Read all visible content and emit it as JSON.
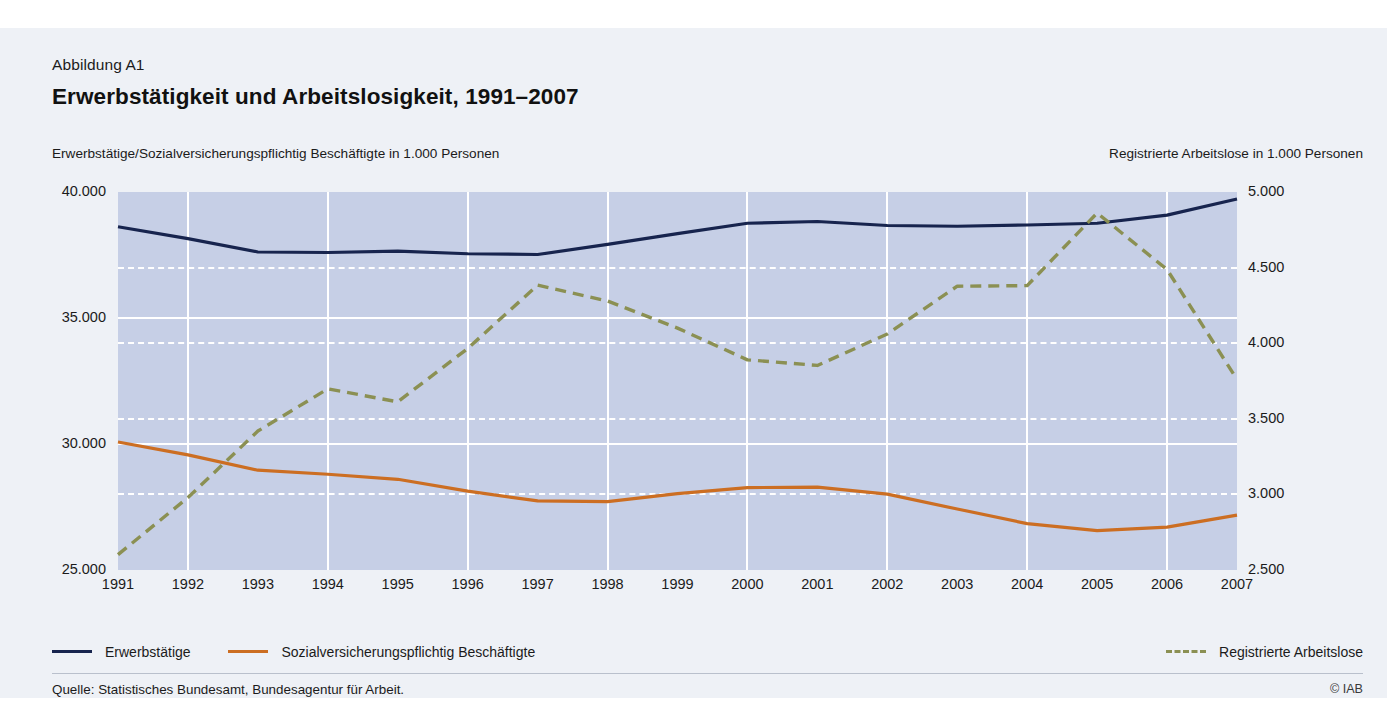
{
  "figure": {
    "label": "Abbildung A1",
    "title": "Erwerbstätigkeit und Arbeitslosigkeit, 1991–2007",
    "left_axis_caption": "Erwerbstätige/Sozialversicherungspflichtig Beschäftigte in 1.000 Personen",
    "right_axis_caption": "Registrierte Arbeitslose in 1.000 Personen",
    "source": "Quelle: Statistisches Bundesamt, Bundesagentur für Arbeit.",
    "copyright": "© IAB"
  },
  "colors": {
    "plot_background": "#c6cfe6",
    "page_background": "#eef1f6",
    "gridline": "#ffffff",
    "erwerbstaetige": "#17244e",
    "sozialversicherungspflichtig": "#cc6e22",
    "arbeitslose": "#8b9053"
  },
  "legend": {
    "items": [
      {
        "label": "Erwerbstätige",
        "style": "solid",
        "color": "#17244e",
        "axis": "left"
      },
      {
        "label": "Sozialversicherungspflichtig Beschäftigte",
        "style": "solid",
        "color": "#cc6e22",
        "axis": "left"
      },
      {
        "label": "Registrierte Arbeitslose",
        "style": "dashed",
        "color": "#8b9053",
        "axis": "right"
      }
    ]
  },
  "chart_data": {
    "type": "line",
    "title": "Erwerbstätigkeit und Arbeitslosigkeit, 1991–2007",
    "xlabel": "",
    "ylabel": "Erwerbstätige/Sozialversicherungspflichtig Beschäftigte in 1.000 Personen",
    "y2label": "Registrierte Arbeitslose in 1.000 Personen",
    "grid": true,
    "legend_position": "below",
    "x": [
      1991,
      1992,
      1993,
      1994,
      1995,
      1996,
      1997,
      1998,
      1999,
      2000,
      2001,
      2002,
      2003,
      2004,
      2005,
      2006,
      2007
    ],
    "xtick_labels": [
      "1991",
      "1992",
      "1993",
      "1994",
      "1995",
      "1996",
      "1997",
      "1998",
      "1999",
      "2000",
      "2001",
      "2002",
      "2003",
      "2004",
      "2005",
      "2006",
      "2007"
    ],
    "ylim": [
      25000,
      40000
    ],
    "ytick_labels": [
      "25.000",
      "30.000",
      "35.000",
      "40.000"
    ],
    "ytick_values": [
      25000,
      30000,
      35000,
      40000
    ],
    "y2lim": [
      2500,
      5000
    ],
    "y2tick_labels": [
      "2.500",
      "3.000",
      "3.500",
      "4.000",
      "4.500",
      "5.000"
    ],
    "y2tick_values": [
      2500,
      3000,
      3500,
      4000,
      4500,
      5000
    ],
    "series": [
      {
        "name": "Erwerbstätige",
        "axis": "left",
        "style": "solid",
        "color": "#17244e",
        "values": [
          38620,
          38150,
          37620,
          37600,
          37650,
          37550,
          37520,
          37920,
          38350,
          38760,
          38830,
          38670,
          38640,
          38690,
          38760,
          39080,
          39720
        ]
      },
      {
        "name": "Sozialversicherungspflichtig Beschäftigte",
        "axis": "left",
        "style": "solid",
        "color": "#cc6e22",
        "values": [
          30080,
          29570,
          28960,
          28800,
          28600,
          28130,
          27740,
          27710,
          28030,
          28270,
          28290,
          28010,
          27420,
          26840,
          26560,
          26700,
          27180
        ]
      },
      {
        "name": "Registrierte Arbeitslose",
        "axis": "right",
        "style": "dashed",
        "color": "#8b9053",
        "values": [
          2602,
          2979,
          3419,
          3698,
          3612,
          3965,
          4384,
          4279,
          4100,
          3890,
          3853,
          4061,
          4377,
          4381,
          4861,
          4487,
          3760
        ]
      }
    ]
  }
}
